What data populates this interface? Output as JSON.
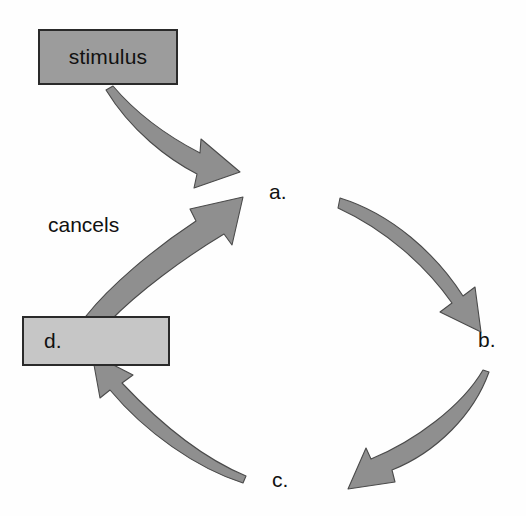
{
  "diagram": {
    "background_color": "#fefefe",
    "nodes": [
      {
        "id": "stimulus",
        "label": "stimulus",
        "shape": "rectangle",
        "fill_color": "#9c9c9c",
        "border_color": "#2a2a2a"
      },
      {
        "id": "d",
        "label": "d.",
        "shape": "rectangle",
        "fill_color": "#c6c6c6",
        "border_color": "#2a2a2a"
      },
      {
        "id": "a",
        "label": "a.",
        "shape": "text"
      },
      {
        "id": "b",
        "label": "b.",
        "shape": "text"
      },
      {
        "id": "c",
        "label": "c.",
        "shape": "text"
      }
    ],
    "edges": [
      {
        "id": "stimulus-to-a",
        "from": "stimulus",
        "to": "a",
        "label": "",
        "style": "tapered-curved-arrow",
        "fill_color": "#8f8f8f"
      },
      {
        "id": "a-to-b",
        "from": "a",
        "to": "b",
        "label": "",
        "style": "tapered-curved-arrow",
        "fill_color": "#8f8f8f"
      },
      {
        "id": "b-to-c",
        "from": "b",
        "to": "c",
        "label": "",
        "style": "tapered-curved-arrow",
        "fill_color": "#8f8f8f"
      },
      {
        "id": "c-to-d",
        "from": "c",
        "to": "d",
        "label": "",
        "style": "tapered-curved-arrow",
        "fill_color": "#8f8f8f"
      },
      {
        "id": "d-to-a",
        "from": "d",
        "to": "a",
        "label": "cancels",
        "style": "tapered-curved-arrow",
        "fill_color": "#8f8f8f"
      }
    ],
    "edge_labels": {
      "cancels": "cancels"
    }
  }
}
